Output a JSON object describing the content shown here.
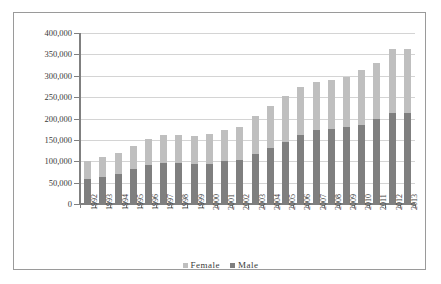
{
  "chart_data": {
    "type": "bar",
    "stacked": true,
    "title": "",
    "xlabel": "",
    "ylabel": "",
    "ylim": [
      0,
      400000
    ],
    "ytick_step": 50000,
    "ytick_labels": [
      "400,000",
      "350,000",
      "300,000",
      "250,000",
      "200,000",
      "150,000",
      "100,000",
      "50,000",
      "0"
    ],
    "ytick_values": [
      400000,
      350000,
      300000,
      250000,
      200000,
      150000,
      100000,
      50000,
      0
    ],
    "grid": true,
    "legend_position": "bottom",
    "categories": [
      "1992",
      "1993",
      "1994",
      "1995",
      "1996",
      "1997",
      "1998",
      "1999",
      "2000",
      "2001",
      "2002",
      "2003",
      "2004",
      "2005",
      "2006",
      "2007",
      "2008",
      "2009",
      "2010",
      "2011",
      "2012",
      "2013"
    ],
    "series": [
      {
        "name": "Male",
        "color": "#7f7f7f",
        "values": [
          59000,
          64000,
          71000,
          82000,
          92000,
          97000,
          96000,
          93000,
          94000,
          100000,
          104000,
          117000,
          132000,
          146000,
          162000,
          173000,
          176000,
          179000,
          185000,
          198000,
          213000,
          214000
        ]
      },
      {
        "name": "Female",
        "color": "#bfbfbf",
        "values": [
          41000,
          46000,
          49000,
          54000,
          60000,
          64000,
          65000,
          66000,
          69000,
          74000,
          77000,
          88000,
          97000,
          107000,
          111000,
          112000,
          113000,
          119000,
          128000,
          132000,
          149000,
          148000
        ]
      }
    ],
    "totals": [
      100000,
      110000,
      120000,
      136000,
      152000,
      161000,
      161000,
      159000,
      163000,
      174000,
      181000,
      205000,
      229000,
      253000,
      273000,
      285000,
      289000,
      298000,
      313000,
      330000,
      362000,
      362000
    ],
    "legend": [
      {
        "label": "Female",
        "color": "#bfbfbf"
      },
      {
        "label": "Male",
        "color": "#7f7f7f"
      }
    ]
  }
}
